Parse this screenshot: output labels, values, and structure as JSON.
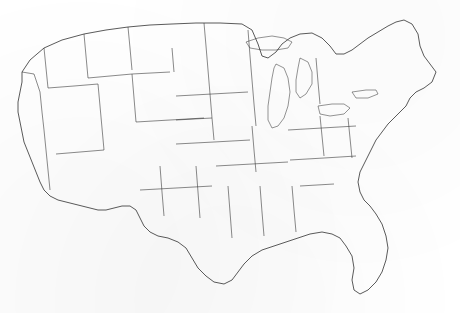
{
  "figure": {
    "kind": "choropleth-map",
    "region": "Contiguous United States",
    "unit": "county",
    "title": "",
    "subtitle": "",
    "caption": "",
    "legend": "",
    "has_title": false,
    "has_legend": false,
    "has_axis_labels": false,
    "alt_text": "Black and white map of the contiguous United States divided into counties, with scattered counties filled solid black."
  },
  "colors": {
    "background": "#ffffff",
    "county_fill": "#ffffff",
    "county_border": "#3a3a3a",
    "highlight_fill": "#1a1a1a",
    "state_border": "#2b2b2b",
    "nation_border": "#242424"
  },
  "chart_data": {
    "type": "map",
    "map_type": "choropleth",
    "projection": "albers-usa",
    "geography": "us-counties-lower48",
    "title": "",
    "xlabel": "",
    "ylabel": "",
    "legend_position": "none",
    "grid": false,
    "value_classes": [
      {
        "label": "not highlighted",
        "fill": "#ffffff",
        "approx_count": 3030
      },
      {
        "label": "highlighted",
        "fill": "#1a1a1a",
        "approx_count": 110
      }
    ],
    "highlight_clusters": [
      {
        "name": "northeast-corridor",
        "description": "Dense black cluster spanning New York City, northern New Jersey, Connecticut and eastern Massachusetts",
        "approx_counties": 34
      },
      {
        "name": "chicago-milwaukee",
        "description": "Black counties around Lake Michigan's southwestern shore",
        "approx_counties": 5
      },
      {
        "name": "northern-rockies",
        "description": "Large black counties in Montana, Idaho and Wyoming",
        "approx_counties": 8
      },
      {
        "name": "nevada-utah",
        "description": "Large black counties in the Great Basin",
        "approx_counties": 5
      },
      {
        "name": "dakotas-nebraska",
        "description": "Scattered black counties across the northern plains",
        "approx_counties": 12
      },
      {
        "name": "texas-gulf",
        "description": "Isolated black counties in Texas and along the Gulf coast",
        "approx_counties": 9
      },
      {
        "name": "southeast-scatter",
        "description": "Isolated black counties across the Appalachians and the Southeast",
        "approx_counties": 14
      }
    ]
  }
}
